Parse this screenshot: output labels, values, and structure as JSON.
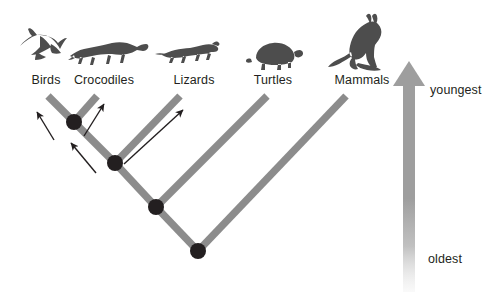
{
  "diagram": {
    "type": "phylogenetic-tree",
    "background_color": "#ffffff",
    "branch_color": "#8c8c8c",
    "node_color": "#231f20",
    "arrow_color": "#231f20",
    "silhouette_color": "#4d4d4d",
    "time_arrow_color": "#9e9e9e",
    "taxa": [
      {
        "label": "Birds",
        "icon": "bird-silhouette",
        "label_x": 46,
        "label_y": 73,
        "icon_x": 14,
        "icon_y": 27,
        "icon_w": 56,
        "icon_h": 42,
        "tip_x": 48,
        "tip_y": 96
      },
      {
        "label": "Crocodiles",
        "icon": "crocodile-silhouette",
        "label_x": 104,
        "label_y": 73,
        "icon_x": 67,
        "icon_y": 36,
        "icon_w": 82,
        "icon_h": 33,
        "tip_x": 97,
        "tip_y": 96
      },
      {
        "label": "Lizards",
        "icon": "lizard-silhouette",
        "label_x": 194,
        "label_y": 73,
        "icon_x": 160,
        "icon_y": 44,
        "icon_w": 62,
        "icon_h": 26,
        "tip_x": 180,
        "tip_y": 96
      },
      {
        "label": "Turtles",
        "icon": "turtle-silhouette",
        "label_x": 273,
        "label_y": 73,
        "icon_x": 248,
        "icon_y": 39,
        "icon_w": 54,
        "icon_h": 32,
        "tip_x": 267,
        "tip_y": 96
      },
      {
        "label": "Mammals",
        "icon": "kangaroo-silhouette",
        "label_x": 362,
        "label_y": 73,
        "icon_x": 327,
        "icon_y": 13,
        "icon_w": 62,
        "icon_h": 57,
        "tip_x": 346,
        "tip_y": 96
      }
    ],
    "nodes": [
      {
        "name": "node-birds-crocodiles",
        "x": 74,
        "y": 122,
        "r": 8
      },
      {
        "name": "node-archosaurs-lizards",
        "x": 115,
        "y": 163,
        "r": 8
      },
      {
        "name": "node-reptiles-turtles",
        "x": 156,
        "y": 207,
        "r": 8
      },
      {
        "name": "node-root-amniotes",
        "x": 198,
        "y": 251,
        "r": 8
      }
    ],
    "branches": [
      {
        "name": "branch-birds",
        "x1": 48,
        "y1": 96,
        "x2": 74,
        "y2": 122
      },
      {
        "name": "branch-crocodiles",
        "x1": 97,
        "y1": 96,
        "x2": 74,
        "y2": 122
      },
      {
        "name": "branch-node1-node2",
        "x1": 74,
        "y1": 122,
        "x2": 115,
        "y2": 163
      },
      {
        "name": "branch-lizards",
        "x1": 180,
        "y1": 96,
        "x2": 115,
        "y2": 163
      },
      {
        "name": "branch-node2-node3",
        "x1": 115,
        "y1": 163,
        "x2": 156,
        "y2": 207
      },
      {
        "name": "branch-turtles",
        "x1": 267,
        "y1": 96,
        "x2": 156,
        "y2": 207
      },
      {
        "name": "branch-node3-node4",
        "x1": 156,
        "y1": 207,
        "x2": 198,
        "y2": 251
      },
      {
        "name": "branch-mammals",
        "x1": 346,
        "y1": 96,
        "x2": 198,
        "y2": 251
      }
    ],
    "annotation_arrows": [
      {
        "name": "arrow-to-birds",
        "x1": 54,
        "y1": 140,
        "x2": 37,
        "y2": 112
      },
      {
        "name": "arrow-to-crocodiles",
        "x1": 84,
        "y1": 136,
        "x2": 104,
        "y2": 104
      },
      {
        "name": "arrow-to-node1",
        "x1": 96,
        "y1": 173,
        "x2": 71,
        "y2": 143
      },
      {
        "name": "arrow-to-lizards",
        "x1": 124,
        "y1": 164,
        "x2": 183,
        "y2": 110
      }
    ],
    "time_axis": {
      "name": "time-arrow",
      "direction": "up",
      "top_label": "youngest",
      "bottom_label": "oldest",
      "top_label_x": 430,
      "top_label_y": 83,
      "bottom_label_x": 428,
      "bottom_label_y": 252,
      "shaft_x": 403,
      "shaft_w": 12,
      "head_tip_y": 61,
      "head_base_y": 86,
      "head_half_w": 16,
      "shaft_bottom_y": 292
    }
  }
}
